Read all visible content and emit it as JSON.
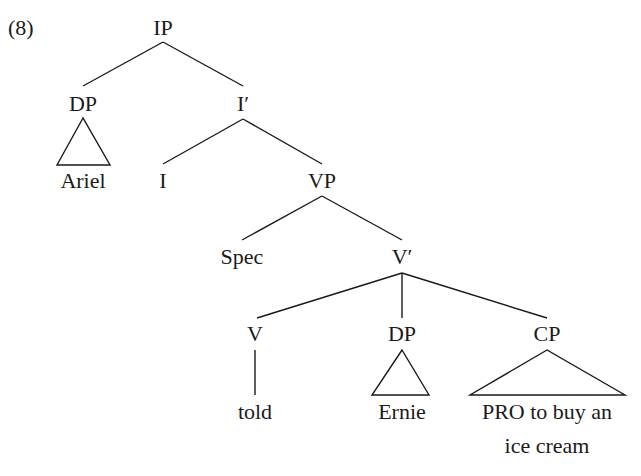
{
  "example_number": "(8)",
  "nodes": {
    "ip": "IP",
    "dp_subject": "DP",
    "i_bar": "I′",
    "ariel": "Ariel",
    "i_head": "I",
    "vp": "VP",
    "spec": "Spec",
    "v_bar": "V′",
    "v_head": "V",
    "dp_object": "DP",
    "cp": "CP",
    "told": "told",
    "ernie": "Ernie",
    "cp_line1": "PRO to buy an",
    "cp_line2": "ice cream"
  }
}
